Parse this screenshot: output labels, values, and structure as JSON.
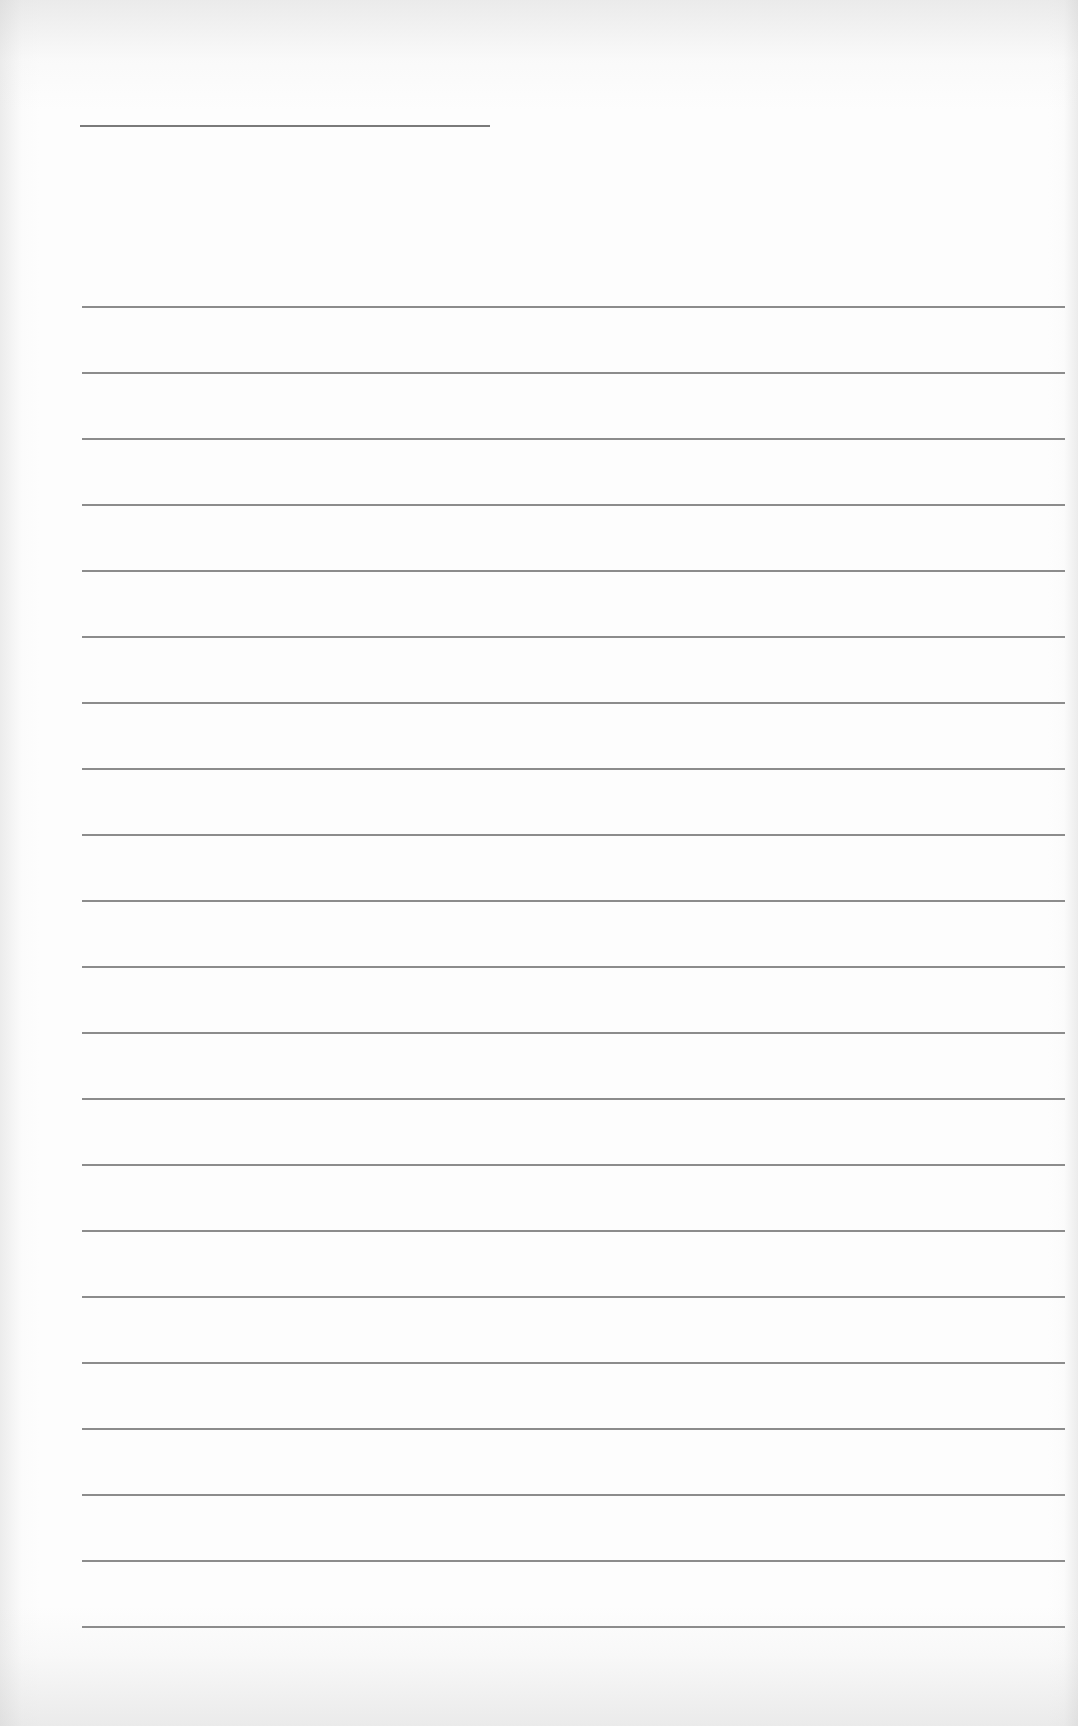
{
  "page": {
    "type": "blank lined paper",
    "background_color": "#fdfdfd",
    "line_color": "#8c8c8c",
    "title_line_color": "#7a7a7a"
  },
  "title_line": {
    "x": 80,
    "y": 125,
    "width": 410,
    "text": ""
  },
  "ruled_lines": {
    "count": 21,
    "x": 82,
    "width": 983,
    "first_y": 306,
    "spacing": 66,
    "lines": [
      {
        "y": 306,
        "text": ""
      },
      {
        "y": 372,
        "text": ""
      },
      {
        "y": 438,
        "text": ""
      },
      {
        "y": 504,
        "text": ""
      },
      {
        "y": 570,
        "text": ""
      },
      {
        "y": 636,
        "text": ""
      },
      {
        "y": 702,
        "text": ""
      },
      {
        "y": 768,
        "text": ""
      },
      {
        "y": 834,
        "text": ""
      },
      {
        "y": 900,
        "text": ""
      },
      {
        "y": 966,
        "text": ""
      },
      {
        "y": 1032,
        "text": ""
      },
      {
        "y": 1098,
        "text": ""
      },
      {
        "y": 1164,
        "text": ""
      },
      {
        "y": 1230,
        "text": ""
      },
      {
        "y": 1296,
        "text": ""
      },
      {
        "y": 1362,
        "text": ""
      },
      {
        "y": 1428,
        "text": ""
      },
      {
        "y": 1494,
        "text": ""
      },
      {
        "y": 1560,
        "text": ""
      },
      {
        "y": 1626,
        "text": ""
      }
    ]
  }
}
